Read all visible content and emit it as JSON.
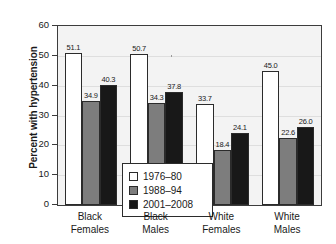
{
  "chart_data": {
    "type": "bar",
    "title": "",
    "subtitle": "",
    "xlabel": "",
    "ylabel": "Percent with hypertension",
    "ylim": [
      0,
      60
    ],
    "ytick_step": 10,
    "yticks": [
      "0",
      "10",
      "20",
      "30",
      "40",
      "50",
      "60"
    ],
    "grid": true,
    "legend_position": "inside-lower-left",
    "categories": [
      "Black Females",
      "Black Males",
      "White Females",
      "White Males"
    ],
    "category_lines": [
      [
        "Black",
        "Females"
      ],
      [
        "Black",
        "Males"
      ],
      [
        "White",
        "Females"
      ],
      [
        "White",
        "Males"
      ]
    ],
    "series": [
      {
        "name": "1976–80",
        "color": "#ffffff",
        "values": [
          51.1,
          50.7,
          33.7,
          45.0
        ],
        "labels": [
          "51.1",
          "50.7",
          "33.7",
          "45.0"
        ]
      },
      {
        "name": "1988–94",
        "color": "#7d7d7d",
        "values": [
          34.9,
          34.3,
          18.4,
          22.6
        ],
        "labels": [
          "34.9",
          "34.3",
          "18.4",
          "22.6"
        ]
      },
      {
        "name": "2001–2008",
        "color": "#181818",
        "values": [
          40.3,
          37.8,
          24.1,
          26.0
        ],
        "labels": [
          "40.3",
          "37.8",
          "24.1",
          "26.0"
        ]
      }
    ]
  },
  "legend": {
    "items": [
      {
        "label": "1976–80",
        "color": "#ffffff"
      },
      {
        "label": "1988–94",
        "color": "#7d7d7d"
      },
      {
        "label": "2001–2008",
        "color": "#181818"
      }
    ]
  },
  "colors": {
    "series_1976_80": "#ffffff",
    "series_1988_94": "#7d7d7d",
    "series_2001_2008": "#181818",
    "plot_background": "#f3f3f3",
    "axis": "#3c3c3c",
    "gridline": "#dedede",
    "text": "#1a1a1a"
  }
}
